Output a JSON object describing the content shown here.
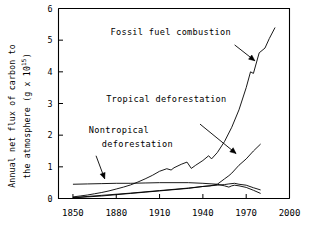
{
  "chart_data": {
    "type": "line",
    "title": "",
    "xlabel": "",
    "ylabel_line1": "Annual net flux of carbon to",
    "ylabel_line2_prefix": "the atmosphere (g x 10",
    "ylabel_line2_exponent": "15",
    "ylabel_line2_suffix": ")",
    "xlim": [
      1840,
      2000
    ],
    "ylim": [
      0,
      6
    ],
    "xticks": [
      "1850",
      "1880",
      "1910",
      "1940",
      "1970",
      "2000"
    ],
    "xtick_values": [
      1850,
      1880,
      1910,
      1940,
      1970,
      2000
    ],
    "yticks": [
      "0",
      "1",
      "2",
      "3",
      "4",
      "5",
      "6"
    ],
    "ytick_values": [
      0,
      1,
      2,
      3,
      4,
      5,
      6
    ],
    "grid": false,
    "legend_position": "inline-annotations",
    "series": [
      {
        "name": "Fossil fuel combustion",
        "x": [
          1850,
          1855,
          1860,
          1865,
          1870,
          1875,
          1880,
          1885,
          1890,
          1895,
          1900,
          1905,
          1910,
          1915,
          1918,
          1920,
          1925,
          1929,
          1932,
          1935,
          1940,
          1944,
          1946,
          1950,
          1955,
          1960,
          1965,
          1970,
          1973,
          1975,
          1979,
          1983,
          1986,
          1990
        ],
        "values": [
          0.05,
          0.08,
          0.11,
          0.15,
          0.19,
          0.24,
          0.3,
          0.36,
          0.43,
          0.52,
          0.62,
          0.73,
          0.86,
          0.94,
          0.9,
          0.97,
          1.08,
          1.15,
          0.95,
          1.05,
          1.2,
          1.35,
          1.25,
          1.45,
          1.8,
          2.25,
          2.8,
          3.5,
          4.0,
          3.95,
          4.6,
          4.75,
          5.05,
          5.4
        ]
      },
      {
        "name": "Tropical deforestation",
        "x": [
          1850,
          1860,
          1870,
          1880,
          1890,
          1900,
          1910,
          1920,
          1930,
          1940,
          1945,
          1950,
          1955,
          1958,
          1960,
          1965,
          1970,
          1975,
          1980
        ],
        "values": [
          0.02,
          0.05,
          0.08,
          0.12,
          0.16,
          0.2,
          0.24,
          0.28,
          0.32,
          0.38,
          0.4,
          0.45,
          0.62,
          0.72,
          0.8,
          1.05,
          1.25,
          1.5,
          1.72
        ]
      },
      {
        "name": "Nontropical deforestation",
        "x": [
          1850,
          1860,
          1870,
          1880,
          1890,
          1900,
          1910,
          1920,
          1930,
          1940,
          1950,
          1955,
          1958,
          1960,
          1962,
          1965,
          1970,
          1975,
          1980
        ],
        "values": [
          0.45,
          0.46,
          0.47,
          0.48,
          0.48,
          0.49,
          0.5,
          0.5,
          0.5,
          0.48,
          0.45,
          0.4,
          0.36,
          0.4,
          0.42,
          0.4,
          0.35,
          0.26,
          0.16
        ]
      },
      {
        "name": "Total deforestation lower",
        "x": [
          1850,
          1870,
          1890,
          1910,
          1930,
          1940,
          1950,
          1955,
          1958,
          1962,
          1965,
          1970,
          1975,
          1980
        ],
        "values": [
          0.03,
          0.1,
          0.17,
          0.25,
          0.33,
          0.38,
          0.42,
          0.44,
          0.46,
          0.48,
          0.45,
          0.42,
          0.34,
          0.27
        ]
      }
    ],
    "annotations": [
      {
        "id": "fossil-fuel-label",
        "text": "Fossil fuel combustion",
        "text_x": 1876,
        "text_y": 5.15,
        "arrow_from_x": 1962,
        "arrow_from_y": 4.85,
        "arrow_to_x": 1976,
        "arrow_to_y": 4.35
      },
      {
        "id": "tropical-deforestation-label",
        "text": "Tropical deforestation",
        "text_x": 1873,
        "text_y": 3.05,
        "arrow_from_x": 1938,
        "arrow_from_y": 2.35,
        "arrow_to_x": 1963,
        "arrow_to_y": 1.42
      },
      {
        "id": "nontropical-deforestation-label",
        "text_line1": "Nontropical",
        "text_line2": "deforestation",
        "text_x": 1861,
        "text_y1": 2.07,
        "text_y2": 1.63,
        "arrow_from_x": 1866,
        "arrow_from_y": 1.35,
        "arrow_to_x": 1872,
        "arrow_to_y": 0.62
      }
    ],
    "colors": {
      "background": "#ffffff",
      "axis": "#000000",
      "curve": "#000000",
      "text": "#000000"
    }
  }
}
